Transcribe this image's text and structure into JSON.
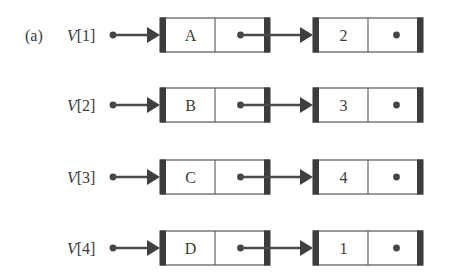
{
  "figure": {
    "panel_label": "(a)",
    "colors": {
      "ink": "#3c3c3c",
      "background": "#ffffff"
    }
  },
  "rows": [
    {
      "array_name": "V",
      "index": "1",
      "nodes": [
        {
          "data": "A",
          "next": "pointer"
        },
        {
          "data": "2",
          "next": "null"
        }
      ]
    },
    {
      "array_name": "V",
      "index": "2",
      "nodes": [
        {
          "data": "B",
          "next": "pointer"
        },
        {
          "data": "3",
          "next": "null"
        }
      ]
    },
    {
      "array_name": "V",
      "index": "3",
      "nodes": [
        {
          "data": "C",
          "next": "pointer"
        },
        {
          "data": "4",
          "next": "null"
        }
      ]
    },
    {
      "array_name": "V",
      "index": "4",
      "nodes": [
        {
          "data": "D",
          "next": "pointer"
        },
        {
          "data": "1",
          "next": "null"
        }
      ]
    }
  ],
  "icons": {
    "pointer_origin": "filled-dot",
    "pointer_arrow": "filled-triangle-arrowhead",
    "null_pointer": "dot-without-arrow"
  }
}
